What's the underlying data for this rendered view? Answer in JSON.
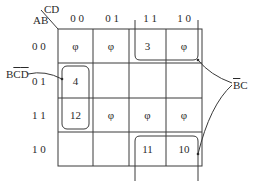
{
  "kmap": {
    "row_var": "AB",
    "col_var": "CD",
    "col_headers": [
      "0 0",
      "0 1",
      "1 1",
      "1 0"
    ],
    "row_headers": [
      "0 0",
      "0 1",
      "1 1",
      "1 0"
    ],
    "cells": [
      [
        "φ",
        "φ",
        "3",
        "φ"
      ],
      [
        "4",
        "",
        "",
        ""
      ],
      [
        "12",
        "φ",
        "φ",
        "φ"
      ],
      [
        "",
        "",
        "11",
        "10"
      ]
    ]
  },
  "annotations": {
    "left_label": {
      "b": "B",
      "c": "C",
      "d": "D"
    },
    "right_label": {
      "b": "B",
      "c": "C"
    }
  }
}
